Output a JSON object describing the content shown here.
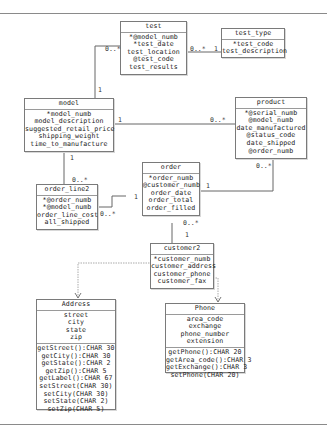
{
  "diagram": {
    "entities": {
      "test": {
        "name": "test",
        "attributes": [
          "*@model_numb",
          "*test_date",
          "test_location",
          "@test_code",
          "test_results"
        ]
      },
      "test_type": {
        "name": "test_type",
        "attributes": [
          "*test_code",
          "test_description"
        ]
      },
      "model": {
        "name": "model",
        "attributes": [
          "*model_numb",
          "model_description",
          "suggested_retail_price",
          "shipping_weight",
          "time_to_manufacture"
        ]
      },
      "product": {
        "name": "product",
        "attributes": [
          "*@serial_numb",
          "@model_numb",
          "date_manufactured",
          "@status_code",
          "date_shipped",
          "@order_numb"
        ]
      },
      "order_line2": {
        "name": "order_line2",
        "attributes": [
          "*@order_numb",
          "*@model_numb",
          "order_line_cost",
          "all_shipped"
        ]
      },
      "order": {
        "name": "order",
        "attributes": [
          "*order_numb",
          "@customer_numb",
          "order_date",
          "order_total",
          "order_filled"
        ]
      },
      "customer2": {
        "name": "customer2",
        "attributes": [
          "*customer_numb",
          "customer_address",
          "customer_phone",
          "customer_fax"
        ]
      },
      "address": {
        "name": "Address",
        "attributes": [
          "street",
          "city",
          "state",
          "zip"
        ],
        "methods": [
          "getStreet():CHAR 30",
          "getCity():CHAR 30",
          "getState():CHAR 2",
          "getZip():CHAR 5",
          "getLabel():CHAR 67",
          "setStreet(CHAR 30)",
          "setCity(CHAR 30)",
          "setState(CHAR 2)",
          "setZip(CHAR 5)"
        ]
      },
      "phone": {
        "name": "Phone",
        "attributes": [
          "area_code",
          "exchange",
          "phone_number",
          "extension"
        ],
        "methods": [
          "getPhone():CHAR 20",
          "getArea_code():CHAR 3",
          "getExchange():CHAR 3",
          "setPhone(CHAR 20)"
        ]
      }
    },
    "multiplicities": {
      "test_model_at_test": "0..*",
      "test_model_at_model": "1",
      "test_testtype_at_test": "0..*",
      "test_testtype_at_type": "1",
      "model_product_at_model": "1",
      "model_product_at_product": "0..*",
      "model_orderline_at_model": "1",
      "model_orderline_at_line": "0..*",
      "orderline_order_at_line": "0..*",
      "orderline_order_at_order": "1",
      "product_order_at_product": "0..*",
      "product_order_at_order": "1",
      "order_customer_at_order": "0..*",
      "order_customer_at_customer": "1"
    }
  }
}
